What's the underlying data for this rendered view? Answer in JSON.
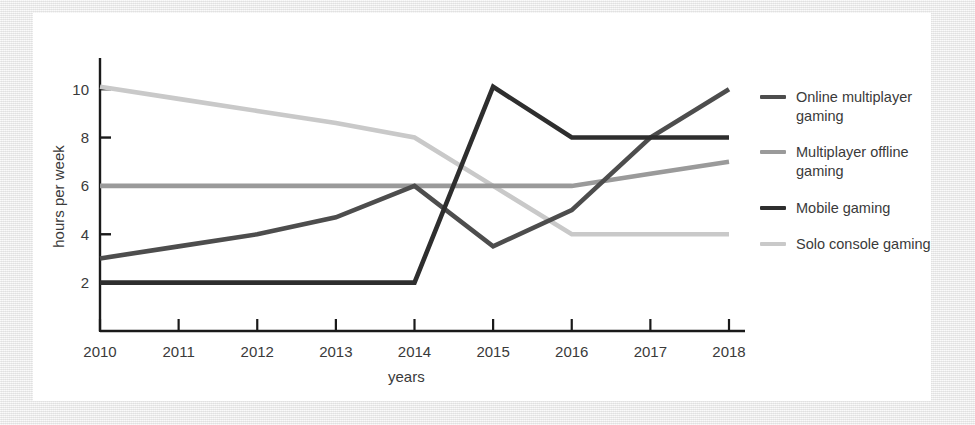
{
  "chart_data": {
    "type": "line",
    "title": "",
    "xlabel": "years",
    "ylabel": "hours per week",
    "categories": [
      "2010",
      "2011",
      "2012",
      "2013",
      "2014",
      "2015",
      "2016",
      "2017",
      "2018"
    ],
    "x": [
      2010,
      2011,
      2012,
      2013,
      2014,
      2015,
      2016,
      2017,
      2018
    ],
    "xlim": [
      2010,
      2018
    ],
    "ylim": [
      0,
      11
    ],
    "y_ticks": [
      2,
      4,
      6,
      8,
      10
    ],
    "grid": false,
    "legend_position": "right",
    "series": [
      {
        "name": "Online multiplayer gaming",
        "color": "#4d4d4d",
        "values": [
          3,
          3.5,
          4,
          4.7,
          6,
          3.5,
          5,
          8,
          10
        ]
      },
      {
        "name": "Multiplayer offline gaming",
        "color": "#9a9a9a",
        "values": [
          6,
          6,
          6,
          6,
          6,
          6,
          6,
          6.5,
          7
        ]
      },
      {
        "name": "Mobile gaming",
        "color": "#2e2e2e",
        "values": [
          2,
          2,
          2,
          2,
          2,
          10.1,
          8,
          8,
          8
        ]
      },
      {
        "name": "Solo console gaming",
        "color": "#c9c9c9",
        "values": [
          10.1,
          9.6,
          9.1,
          8.6,
          8,
          6,
          4,
          4,
          4
        ]
      }
    ]
  },
  "legend": {
    "items": [
      {
        "label": "Online multiplayer gaming",
        "color": "#4d4d4d"
      },
      {
        "label": "Multiplayer offline gaming",
        "color": "#9a9a9a"
      },
      {
        "label": "Mobile gaming",
        "color": "#2e2e2e"
      },
      {
        "label": "Solo console gaming",
        "color": "#c9c9c9"
      }
    ]
  },
  "axes": {
    "x_title": "years",
    "y_title": "hours per week"
  }
}
